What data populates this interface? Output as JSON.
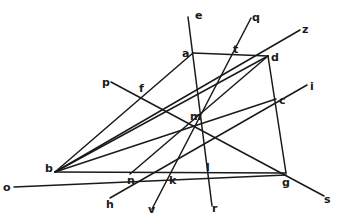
{
  "diagram": {
    "title": "",
    "labels": {
      "o": "o",
      "b": "b",
      "a": "a",
      "t": "t",
      "d": "d",
      "z": "z",
      "e": "e",
      "q": "q",
      "p": "p",
      "f": "f",
      "i": "i",
      "c": "c",
      "m": "m",
      "n": "n",
      "k": "k",
      "l": "l",
      "g": "g",
      "s": "s",
      "h": "h",
      "v": "v",
      "r": "r"
    },
    "points": {
      "o": [
        14,
        187
      ],
      "b": [
        55,
        172
      ],
      "a": [
        193,
        53
      ],
      "t": [
        235,
        54
      ],
      "d": [
        268,
        56
      ],
      "z": [
        300,
        30
      ],
      "e": [
        188,
        17
      ],
      "q": [
        251,
        18
      ],
      "p": [
        111,
        82
      ],
      "f": [
        143,
        96
      ],
      "i": [
        307,
        85
      ],
      "c": [
        276,
        99
      ],
      "m": [
        196,
        119
      ],
      "n": [
        130,
        174
      ],
      "k": [
        173,
        174
      ],
      "l": [
        208,
        173
      ],
      "g": [
        286,
        175
      ],
      "s": [
        324,
        196
      ],
      "h": [
        110,
        198
      ],
      "v": [
        152,
        209
      ],
      "r": [
        212,
        206
      ]
    },
    "segments": [
      [
        "o",
        "g"
      ],
      [
        "b",
        "a"
      ],
      [
        "a",
        "d"
      ],
      [
        "d",
        "g"
      ],
      [
        "b",
        "z"
      ],
      [
        "b",
        "c"
      ],
      [
        "b",
        "m"
      ],
      [
        "e",
        "r"
      ],
      [
        "q",
        "v"
      ],
      [
        "p",
        "s"
      ],
      [
        "h",
        "i"
      ],
      [
        "n",
        "d"
      ]
    ]
  }
}
